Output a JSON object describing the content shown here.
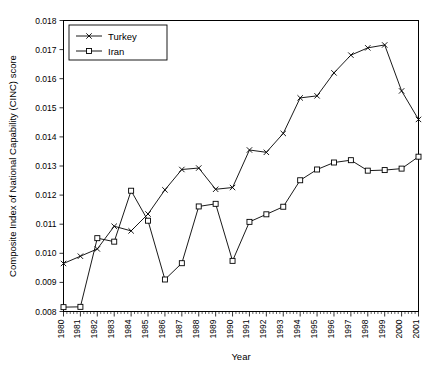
{
  "chart_data": {
    "type": "line",
    "title": "",
    "xlabel": "Year",
    "ylabel": "Composite Index of National Capability (CINC) score",
    "xlim": [
      1980,
      2001
    ],
    "ylim": [
      0.008,
      0.018
    ],
    "ytick_labels": [
      "0.018",
      "0.017",
      "0.016",
      "0.015",
      "0.014",
      "0.013",
      "0.012",
      "0.011",
      "0.010",
      "0.009",
      "0.008"
    ],
    "ytick_values": [
      0.018,
      0.017,
      0.016,
      0.015,
      0.014,
      0.013,
      0.012,
      0.011,
      0.01,
      0.009,
      0.008
    ],
    "categories": [
      "1980",
      "1981",
      "1982",
      "1983",
      "1984",
      "1985",
      "1986",
      "1987",
      "1988",
      "1989",
      "1990",
      "1991",
      "1992",
      "1993",
      "1994",
      "1995",
      "1996",
      "1997",
      "1998",
      "1999",
      "2000",
      "2001"
    ],
    "x": [
      1980,
      1981,
      1982,
      1983,
      1984,
      1985,
      1986,
      1987,
      1988,
      1989,
      1990,
      1991,
      1992,
      1993,
      1994,
      1995,
      1996,
      1997,
      1998,
      1999,
      2000,
      2001
    ],
    "grid": false,
    "legend_position": "top-left",
    "series": [
      {
        "name": "Turkey",
        "marker": "x",
        "values": [
          0.00965,
          0.0099,
          0.01015,
          0.01093,
          0.01077,
          0.01135,
          0.01218,
          0.01288,
          0.01293,
          0.0122,
          0.01226,
          0.01355,
          0.01347,
          0.01412,
          0.01534,
          0.01541,
          0.0162,
          0.01681,
          0.01706,
          0.01716,
          0.01558,
          0.0146
        ]
      },
      {
        "name": "Iran",
        "marker": "square",
        "values": [
          0.00815,
          0.00816,
          0.01052,
          0.0104,
          0.01215,
          0.01112,
          0.0091,
          0.00966,
          0.01161,
          0.0117,
          0.00974,
          0.01108,
          0.01134,
          0.0116,
          0.01251,
          0.01288,
          0.01312,
          0.0132,
          0.01284,
          0.01286,
          0.01291,
          0.01332
        ]
      }
    ]
  },
  "legend": {
    "entries": [
      {
        "label": "Turkey"
      },
      {
        "label": "Iran"
      }
    ]
  }
}
